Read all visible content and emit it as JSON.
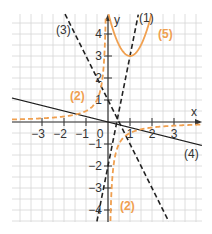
{
  "chart_data": {
    "type": "line",
    "title": "",
    "xlabel": "x",
    "ylabel": "y",
    "xlim": [
      -4.4,
      4.2
    ],
    "ylim": [
      -4.5,
      4.9
    ],
    "grid": true,
    "grid_step": 0.5,
    "x_ticks": [
      -3,
      -2,
      -1,
      1,
      2,
      3
    ],
    "y_ticks": [
      -4,
      -3,
      -2,
      -1,
      1,
      2,
      3,
      4
    ],
    "x_tick_labels": [
      "−3",
      "−2",
      "−1",
      "1",
      "2",
      "3"
    ],
    "y_tick_labels": [
      "−4",
      "−3",
      "−2",
      "−1",
      "1",
      "2",
      "3",
      "4"
    ],
    "origin_label": "0",
    "series": [
      {
        "name": "(1)",
        "kind": "linear",
        "formula": "y = 5x - 2",
        "style": "dashed",
        "color": "#222222"
      },
      {
        "name": "(2)",
        "kind": "hyperbola",
        "formula": "y = -1/(2x)",
        "style": "dashed",
        "color": "#f0a050"
      },
      {
        "name": "(3)",
        "kind": "linear",
        "formula": "y = -2x + 1",
        "style": "dashed",
        "color": "#222222"
      },
      {
        "name": "(4)",
        "kind": "linear",
        "formula": "y = -0.25x",
        "style": "solid",
        "color": "#222222"
      },
      {
        "name": "(5)",
        "kind": "parabola",
        "formula": "y = 2(x-1)^2 + 3",
        "style": "solid",
        "color": "#f0a050"
      }
    ],
    "labels": {
      "s1": "(1)",
      "s2a": "(2)",
      "s2b": "(2)",
      "s3": "(3)",
      "s4": "(4)",
      "s5": "(5)"
    }
  },
  "colors": {
    "black": "#222222",
    "orange": "#f0a050",
    "grid": "#d6d6d6"
  }
}
